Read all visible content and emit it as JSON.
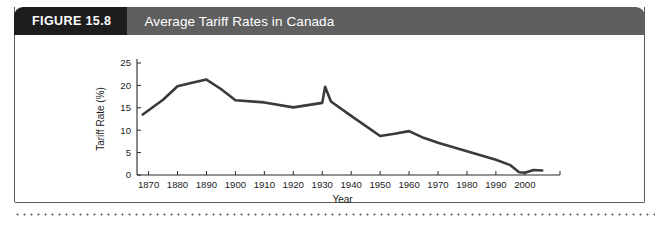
{
  "figure": {
    "tag": "FIGURE 15.8",
    "title": "Average Tariff Rates in Canada",
    "tag_bg": "#1d1d1d",
    "title_bg": "#5f5f5f"
  },
  "chart_data": {
    "type": "line",
    "title": "Average Tariff Rates in Canada",
    "xlabel": "Year",
    "ylabel": "Tariff Rate (%)",
    "xlim": [
      1866,
      2008
    ],
    "ylim": [
      0,
      25
    ],
    "yticks": [
      0,
      5,
      10,
      15,
      20,
      25
    ],
    "xticks": [
      1870,
      1880,
      1890,
      1900,
      1910,
      1920,
      1930,
      1940,
      1950,
      1960,
      1970,
      1980,
      1990,
      2000
    ],
    "ytick_labels": [
      "0",
      "5",
      "10",
      "15",
      "20",
      "25"
    ],
    "xtick_labels": [
      "1870",
      "1880",
      "1890",
      "1900",
      "1910",
      "1920",
      "1930",
      "1940",
      "1950",
      "1960",
      "1970",
      "1980",
      "1990",
      "2000"
    ],
    "grid": false,
    "legend": null,
    "line_color": "#3a3a3a",
    "series": [
      {
        "name": "Average tariff rate",
        "x": [
          1868,
          1875,
          1880,
          1885,
          1890,
          1895,
          1900,
          1910,
          1920,
          1925,
          1930,
          1931,
          1933,
          1940,
          1950,
          1955,
          1960,
          1965,
          1970,
          1980,
          1990,
          1995,
          1998,
          2000,
          2003,
          2006
        ],
        "y": [
          13.5,
          16.8,
          19.8,
          20.6,
          21.3,
          19.2,
          16.7,
          16.2,
          15.1,
          15.6,
          16.1,
          19.7,
          16.4,
          13.2,
          8.7,
          9.2,
          9.8,
          8.3,
          7.2,
          5.3,
          3.4,
          2.2,
          0.6,
          0.5,
          1.1,
          1.0
        ]
      }
    ]
  },
  "labels": {
    "y_axis": "Tariff Rate (%)",
    "x_axis": "Year"
  }
}
